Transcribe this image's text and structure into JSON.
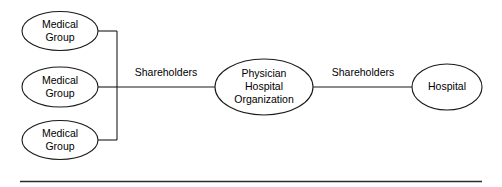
{
  "diagram": {
    "type": "entity-relationship-diagram",
    "colors": {
      "stroke": "#1a1a1a",
      "node_fill": "#ffffff",
      "text": "#000000",
      "background": "#ffffff",
      "footer_rule": "#2b2b2b"
    },
    "nodes": [
      {
        "id": "medical-group-1",
        "shape": "ellipse",
        "lines": [
          "Medical",
          "Group"
        ]
      },
      {
        "id": "medical-group-2",
        "shape": "ellipse",
        "lines": [
          "Medical",
          "Group"
        ]
      },
      {
        "id": "medical-group-3",
        "shape": "ellipse",
        "lines": [
          "Medical",
          "Group"
        ]
      },
      {
        "id": "physician-hospital-organization",
        "shape": "ellipse",
        "lines": [
          "Physician",
          "Hospital",
          "Organization"
        ]
      },
      {
        "id": "hospital",
        "shape": "ellipse",
        "lines": [
          "Hospital"
        ]
      }
    ],
    "edges": [
      {
        "id": "medical-groups-to-pho",
        "label": "Shareholders",
        "from": [
          "medical-group-1",
          "medical-group-2",
          "medical-group-3"
        ],
        "to": "physician-hospital-organization",
        "style": "bracket-trunk"
      },
      {
        "id": "pho-to-hospital",
        "label": "Shareholders",
        "from": "physician-hospital-organization",
        "to": "hospital",
        "style": "straight"
      }
    ],
    "footer_rule": {
      "present": true
    }
  }
}
